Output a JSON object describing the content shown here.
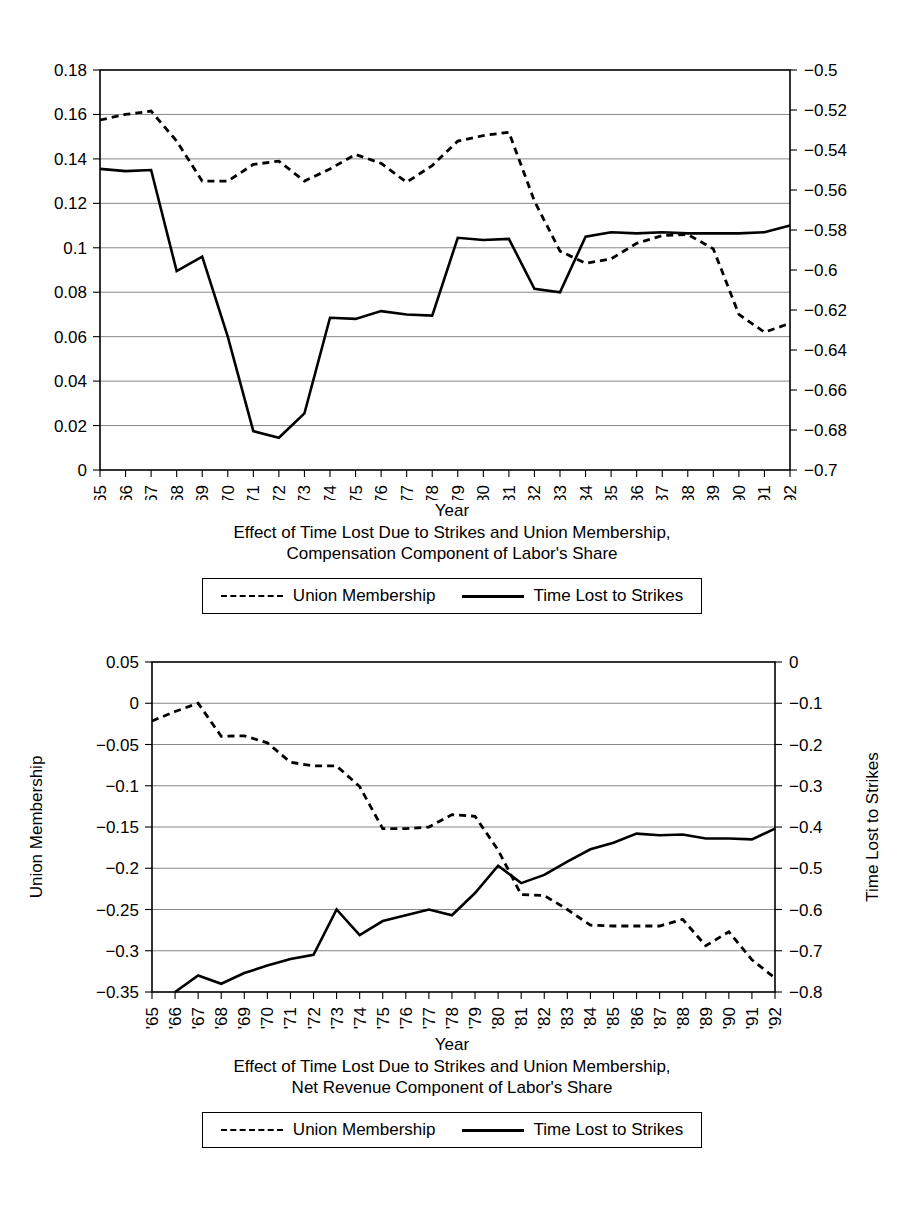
{
  "charts": [
    {
      "id": "compensation",
      "type": "line",
      "title_line1": "Effect of Time Lost Due to Strikes and Union Membership,",
      "title_line2": "Compensation Component of Labor's Share",
      "xlabel": "Year",
      "left_axis_title": "",
      "right_axis_title": "",
      "categories": [
        "'65",
        "'66",
        "'67",
        "'68",
        "'69",
        "'70",
        "'71",
        "'72",
        "'73",
        "'74",
        "'75",
        "'76",
        "'77",
        "'78",
        "'79",
        "'80",
        "'81",
        "'82",
        "'83",
        "'84",
        "'85",
        "'86",
        "'87",
        "'88",
        "'89",
        "'90",
        "'91",
        "'92"
      ],
      "left_ticks": [
        "0",
        "0.02",
        "0.04",
        "0.06",
        "0.08",
        "0.1",
        "0.12",
        "0.14",
        "0.16",
        "0.18"
      ],
      "right_ticks": [
        "−0.7",
        "−0.68",
        "−0.66",
        "−0.64",
        "−0.62",
        "−0.6",
        "−0.58",
        "−0.56",
        "−0.54",
        "−0.52",
        "−0.5"
      ],
      "ylim_left": [
        0,
        0.18
      ],
      "ylim_right": [
        -0.7,
        -0.5
      ],
      "grid": true,
      "legend_position": "bottom",
      "series": [
        {
          "name": "Union Membership",
          "style": "dashed",
          "axis": "left",
          "values": [
            0.1575,
            0.16,
            0.1615,
            0.148,
            0.13,
            0.13,
            0.1375,
            0.139,
            0.13,
            0.1355,
            0.142,
            0.138,
            0.1295,
            0.137,
            0.148,
            0.1505,
            0.152,
            0.121,
            0.0985,
            0.093,
            0.095,
            0.102,
            0.1055,
            0.106,
            0.0995,
            0.07,
            0.062,
            0.066
          ]
        },
        {
          "name": "Time Lost to Strikes",
          "style": "solid",
          "axis": "left",
          "values": [
            0.1355,
            0.1345,
            0.135,
            0.0895,
            0.096,
            0.06,
            0.0175,
            0.0145,
            0.0255,
            0.0685,
            0.068,
            0.0715,
            0.07,
            0.0695,
            0.1045,
            0.1035,
            0.104,
            0.0815,
            0.08,
            0.105,
            0.107,
            0.1065,
            0.107,
            0.1065,
            0.1065,
            0.1065,
            0.107,
            0.11
          ]
        }
      ],
      "legend": [
        {
          "label": "Union Membership",
          "style": "dashed"
        },
        {
          "label": "Time Lost to Strikes",
          "style": "solid"
        }
      ]
    },
    {
      "id": "net-revenue",
      "type": "line",
      "title_line1": "Effect of Time Lost Due to Strikes and Union Membership,",
      "title_line2": "Net Revenue Component of Labor's Share",
      "xlabel": "Year",
      "left_axis_title": "Union Membership",
      "right_axis_title": "Time Lost to Strikes",
      "categories": [
        "'65",
        "'66",
        "'67",
        "'68",
        "'69",
        "'70",
        "'71",
        "'72",
        "'73",
        "'74",
        "'75",
        "'76",
        "'77",
        "'78",
        "'79",
        "'80",
        "'81",
        "'82",
        "'83",
        "'84",
        "'85",
        "'86",
        "'87",
        "'88",
        "'89",
        "'90",
        "'91",
        "'92"
      ],
      "left_ticks": [
        "−0.35",
        "−0.3",
        "−0.25",
        "−0.2",
        "−0.15",
        "−0.1",
        "−0.05",
        "0",
        "0.05"
      ],
      "right_ticks": [
        "−0.8",
        "−0.7",
        "−0.6",
        "−0.5",
        "−0.4",
        "−0.3",
        "−0.2",
        "−0.1",
        "0"
      ],
      "ylim_left": [
        -0.35,
        0.05
      ],
      "ylim_right": [
        -0.8,
        0.0
      ],
      "grid": true,
      "legend_position": "bottom",
      "series": [
        {
          "name": "Union Membership",
          "style": "dashed",
          "axis": "left",
          "values": [
            -0.0215,
            -0.01,
            0.0,
            -0.04,
            -0.0395,
            -0.048,
            -0.0715,
            -0.076,
            -0.076,
            -0.101,
            -0.152,
            -0.152,
            -0.15,
            -0.135,
            -0.137,
            -0.178,
            -0.232,
            -0.233,
            -0.25,
            -0.269,
            -0.27,
            -0.27,
            -0.27,
            -0.262,
            -0.294,
            -0.277,
            -0.311,
            -0.333
          ]
        },
        {
          "name": "Time Lost to Strikes",
          "style": "solid",
          "axis": "left",
          "values": [
            null,
            -0.35,
            -0.33,
            -0.34,
            -0.327,
            -0.318,
            -0.31,
            -0.305,
            -0.25,
            -0.281,
            -0.264,
            -0.257,
            -0.25,
            -0.257,
            -0.23,
            -0.197,
            -0.218,
            -0.208,
            -0.192,
            -0.177,
            -0.169,
            -0.158,
            -0.16,
            -0.159,
            -0.164,
            -0.164,
            -0.165,
            -0.152
          ]
        }
      ],
      "legend": [
        {
          "label": "Union Membership",
          "style": "dashed"
        },
        {
          "label": "Time Lost to Strikes",
          "style": "solid"
        }
      ]
    }
  ]
}
